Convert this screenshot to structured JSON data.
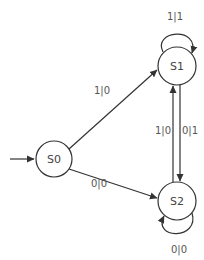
{
  "diagram": {
    "type": "state-machine",
    "states": [
      {
        "id": "S0",
        "label": "S0",
        "initial": true
      },
      {
        "id": "S1",
        "label": "S1"
      },
      {
        "id": "S2",
        "label": "S2"
      }
    ],
    "transitions": [
      {
        "from": "S0",
        "to": "S1",
        "label": "1|0"
      },
      {
        "from": "S0",
        "to": "S2",
        "label": "0|0"
      },
      {
        "from": "S1",
        "to": "S1",
        "label": "1|1"
      },
      {
        "from": "S1",
        "to": "S2",
        "label": "0|1"
      },
      {
        "from": "S2",
        "to": "S1",
        "label": "1|0"
      },
      {
        "from": "S2",
        "to": "S2",
        "label": "0|0"
      }
    ],
    "colors": {
      "stroke": "#333333",
      "text": "#555555",
      "background": "#ffffff"
    }
  }
}
